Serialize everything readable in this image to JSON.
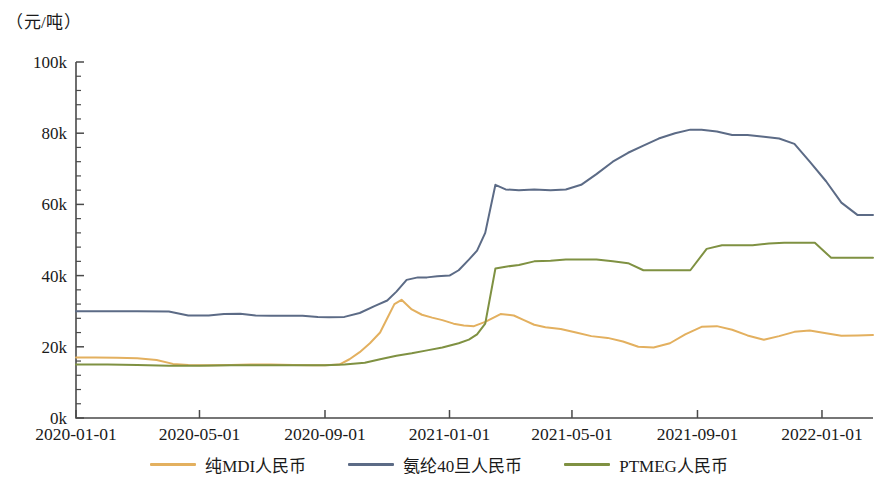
{
  "chart_data": {
    "type": "line",
    "title": "",
    "subtitle": "",
    "ylabel": "（元/吨）",
    "xlabel": "",
    "grid": false,
    "legend_position": "bottom",
    "ylim": [
      0,
      100000
    ],
    "ytick_labels": [
      "0k",
      "20k",
      "40k",
      "60k",
      "80k",
      "100k"
    ],
    "ytick_values": [
      0,
      20000,
      40000,
      60000,
      80000,
      100000
    ],
    "y_minor_ticks_per_interval": 4,
    "xlim": [
      "2020-01-01",
      "2022-02-20"
    ],
    "xtick_labels": [
      "2020-01-01",
      "2020-05-01",
      "2020-09-01",
      "2021-01-01",
      "2021-05-01",
      "2021-09-01",
      "2022-01-01"
    ],
    "series": [
      {
        "name": "纯MDI人民币",
        "color": "#e3b05f",
        "x": [
          "2020-01-01",
          "2020-01-20",
          "2020-02-10",
          "2020-03-01",
          "2020-03-20",
          "2020-04-05",
          "2020-04-20",
          "2020-05-10",
          "2020-06-01",
          "2020-06-20",
          "2020-07-10",
          "2020-08-01",
          "2020-08-20",
          "2020-09-01",
          "2020-09-15",
          "2020-09-25",
          "2020-10-05",
          "2020-10-15",
          "2020-10-25",
          "2020-11-01",
          "2020-11-08",
          "2020-11-15",
          "2020-11-25",
          "2020-12-05",
          "2020-12-15",
          "2020-12-25",
          "2021-01-05",
          "2021-01-15",
          "2021-01-25",
          "2021-02-05",
          "2021-02-20",
          "2021-03-05",
          "2021-03-15",
          "2021-03-25",
          "2021-04-05",
          "2021-04-20",
          "2021-05-05",
          "2021-05-20",
          "2021-06-05",
          "2021-06-20",
          "2021-07-05",
          "2021-07-20",
          "2021-08-05",
          "2021-08-20",
          "2021-09-05",
          "2021-09-20",
          "2021-10-05",
          "2021-10-20",
          "2021-11-05",
          "2021-11-20",
          "2021-12-05",
          "2021-12-20",
          "2022-01-05",
          "2022-01-20",
          "2022-02-05",
          "2022-02-20"
        ],
        "values": [
          17000,
          17000,
          16900,
          16800,
          16300,
          15200,
          14900,
          14800,
          14900,
          15000,
          15000,
          14900,
          14800,
          14800,
          15000,
          16500,
          18500,
          21000,
          24000,
          28000,
          32000,
          33200,
          30500,
          29000,
          28200,
          27500,
          26500,
          26000,
          25800,
          27000,
          29200,
          28800,
          27500,
          26200,
          25500,
          25000,
          24000,
          23000,
          22500,
          21500,
          20000,
          19800,
          21000,
          23500,
          25600,
          25800,
          24800,
          23200,
          22000,
          23000,
          24200,
          24600,
          23800,
          23100,
          23200,
          23300
        ]
      },
      {
        "name": "氨纶40旦人民币",
        "color": "#5c6b86",
        "x": [
          "2020-01-01",
          "2020-02-01",
          "2020-03-01",
          "2020-04-01",
          "2020-04-20",
          "2020-05-10",
          "2020-05-25",
          "2020-06-10",
          "2020-06-25",
          "2020-07-10",
          "2020-07-25",
          "2020-08-10",
          "2020-08-25",
          "2020-09-05",
          "2020-09-20",
          "2020-10-05",
          "2020-10-20",
          "2020-11-01",
          "2020-11-10",
          "2020-11-20",
          "2020-12-01",
          "2020-12-10",
          "2020-12-20",
          "2021-01-01",
          "2021-01-10",
          "2021-01-20",
          "2021-01-28",
          "2021-02-05",
          "2021-02-15",
          "2021-02-25",
          "2021-03-10",
          "2021-03-25",
          "2021-04-10",
          "2021-04-25",
          "2021-05-10",
          "2021-05-25",
          "2021-06-10",
          "2021-06-25",
          "2021-07-10",
          "2021-07-25",
          "2021-08-10",
          "2021-08-25",
          "2021-09-05",
          "2021-09-20",
          "2021-10-05",
          "2021-10-20",
          "2021-11-05",
          "2021-11-20",
          "2021-12-05",
          "2021-12-20",
          "2022-01-05",
          "2022-01-20",
          "2022-02-05",
          "2022-02-20"
        ],
        "values": [
          30000,
          30000,
          30000,
          29900,
          28800,
          28800,
          29200,
          29300,
          28800,
          28700,
          28700,
          28700,
          28400,
          28300,
          28400,
          29500,
          31500,
          33000,
          35500,
          38800,
          39500,
          39500,
          39800,
          40000,
          41500,
          44500,
          47000,
          52000,
          65500,
          64200,
          64000,
          64200,
          64000,
          64200,
          65500,
          68500,
          72000,
          74500,
          76500,
          78500,
          80000,
          81000,
          81000,
          80500,
          79500,
          79500,
          79000,
          78500,
          77000,
          72000,
          66500,
          60500,
          57000,
          57000
        ]
      },
      {
        "name": "PTMEG人民币",
        "color": "#7f9142",
        "x": [
          "2020-01-01",
          "2020-02-01",
          "2020-03-01",
          "2020-04-01",
          "2020-05-01",
          "2020-06-01",
          "2020-07-01",
          "2020-08-01",
          "2020-09-01",
          "2020-09-20",
          "2020-10-10",
          "2020-10-25",
          "2020-11-10",
          "2020-11-25",
          "2020-12-10",
          "2020-12-25",
          "2021-01-10",
          "2021-01-20",
          "2021-01-28",
          "2021-02-05",
          "2021-02-15",
          "2021-02-25",
          "2021-03-10",
          "2021-03-25",
          "2021-04-10",
          "2021-04-25",
          "2021-05-10",
          "2021-05-25",
          "2021-06-10",
          "2021-06-25",
          "2021-07-10",
          "2021-07-25",
          "2021-08-10",
          "2021-08-25",
          "2021-09-10",
          "2021-09-25",
          "2021-10-10",
          "2021-10-25",
          "2021-11-10",
          "2021-11-25",
          "2021-12-10",
          "2021-12-25",
          "2022-01-10",
          "2022-01-25",
          "2022-02-10",
          "2022-02-20"
        ],
        "values": [
          15000,
          15000,
          14900,
          14700,
          14700,
          14800,
          14800,
          14800,
          14800,
          15000,
          15500,
          16500,
          17500,
          18200,
          19000,
          19800,
          21000,
          22000,
          23500,
          26500,
          42000,
          42500,
          43000,
          44000,
          44200,
          44500,
          44500,
          44500,
          44000,
          43500,
          41500,
          41500,
          41500,
          41500,
          47500,
          48500,
          48500,
          48500,
          49000,
          49200,
          49200,
          49200,
          45000,
          45000,
          45000,
          45000
        ]
      }
    ]
  },
  "legend": {
    "items": [
      {
        "label": "纯MDI人民币",
        "color": "#e3b05f"
      },
      {
        "label": "氨纶40旦人民币",
        "color": "#5c6b86"
      },
      {
        "label": "PTMEG人民币",
        "color": "#7f9142"
      }
    ]
  }
}
